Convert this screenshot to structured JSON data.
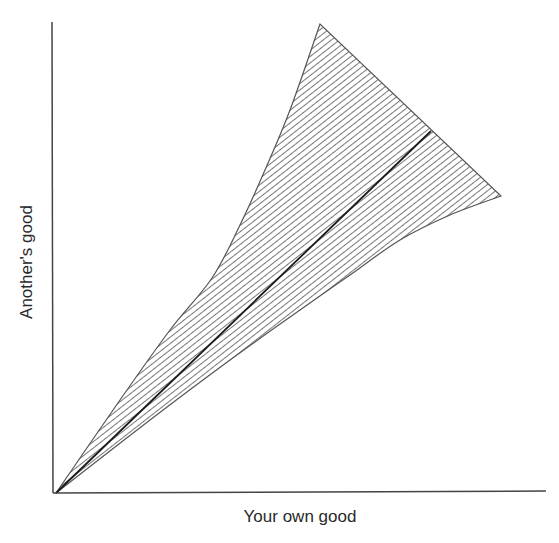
{
  "chart_data": {
    "type": "area",
    "title": "",
    "xlabel": "Your own good",
    "ylabel": "Another's good",
    "grid": false,
    "legend": null,
    "ticks": {
      "x": [],
      "y": []
    },
    "origin_px": [
      56,
      493
    ],
    "axes_px": {
      "x_end": [
        546,
        491
      ],
      "y_top": [
        52,
        22
      ]
    },
    "series": [
      {
        "name": "upper-boundary",
        "points_px": [
          [
            56,
            493
          ],
          [
            120,
            400
          ],
          [
            170,
            330
          ],
          [
            212,
            278
          ],
          [
            240,
            225
          ],
          [
            265,
            170
          ],
          [
            290,
            110
          ],
          [
            320,
            24
          ]
        ]
      },
      {
        "name": "right-edge",
        "points_px": [
          [
            320,
            24
          ],
          [
            431,
            131
          ],
          [
            501,
            196
          ]
        ]
      },
      {
        "name": "lower-boundary",
        "points_px": [
          [
            501,
            196
          ],
          [
            450,
            215
          ],
          [
            400,
            240
          ],
          [
            350,
            275
          ],
          [
            300,
            310
          ],
          [
            230,
            360
          ],
          [
            150,
            420
          ],
          [
            56,
            493
          ]
        ]
      },
      {
        "name": "center-line",
        "points_px": [
          [
            56,
            493
          ],
          [
            431,
            131
          ]
        ]
      }
    ],
    "fill": {
      "pattern": "diagonal-hatch",
      "color": "#555555",
      "spacing_px": 5
    },
    "colors": {
      "axis": "#444444",
      "center_line": "#1a1a1a",
      "outline": "#555555",
      "background": "#ffffff"
    }
  }
}
